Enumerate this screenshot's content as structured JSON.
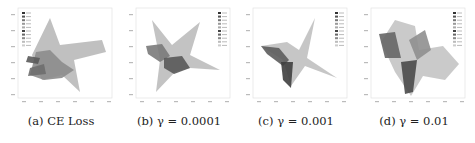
{
  "figure": {
    "panels": [
      {
        "id": "a",
        "caption": "(a) CE Loss",
        "legend_entries": 10
      },
      {
        "id": "b",
        "caption": "(b) γ = 0.0001",
        "legend_entries": 10
      },
      {
        "id": "c",
        "caption": "(c) γ = 0.001",
        "legend_entries": 10
      },
      {
        "id": "d",
        "caption": "(d) γ = 0.01",
        "legend_entries": 10
      }
    ]
  },
  "chart_data": [
    {
      "type": "scatter",
      "title": "(a) CE Loss",
      "legend": "top-left",
      "n_classes": 10
    },
    {
      "type": "scatter",
      "title": "(b) γ = 0.0001",
      "legend": "top-right",
      "n_classes": 10
    },
    {
      "type": "scatter",
      "title": "(c) γ = 0.001",
      "legend": "top-right",
      "n_classes": 10
    },
    {
      "type": "scatter",
      "title": "(d) γ = 0.01",
      "legend": "top-right",
      "n_classes": 10
    }
  ]
}
